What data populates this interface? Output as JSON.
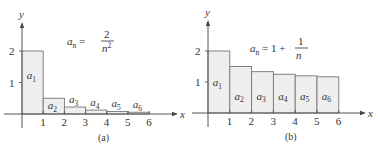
{
  "chart_data": [
    {
      "type": "bar",
      "panel": "a",
      "caption": "(a)",
      "formula": {
        "lhs": "a",
        "lhs_sub": "n",
        "eq": "=",
        "num": "2",
        "den": "n",
        "den_sup": "2"
      },
      "xlabel": "x",
      "ylabel": "y",
      "x_ticks": [
        "1",
        "2",
        "3",
        "4",
        "5",
        "6"
      ],
      "y_ticks": [
        "1",
        "2"
      ],
      "categories": [
        "a1",
        "a2",
        "a3",
        "a4",
        "a5",
        "a6"
      ],
      "bar_labels": [
        {
          "base": "a",
          "sub": "1"
        },
        {
          "base": "a",
          "sub": "2"
        },
        {
          "base": "a",
          "sub": "3"
        },
        {
          "base": "a",
          "sub": "4"
        },
        {
          "base": "a",
          "sub": "5"
        },
        {
          "base": "a",
          "sub": "6"
        }
      ],
      "values": [
        2.0,
        0.5,
        0.222,
        0.125,
        0.08,
        0.056
      ],
      "xlim": [
        0,
        6
      ],
      "ylim": [
        0,
        2.5
      ],
      "grid": false
    },
    {
      "type": "bar",
      "panel": "b",
      "caption": "(b)",
      "formula": {
        "lhs": "a",
        "lhs_sub": "n",
        "eq": "= 1 +",
        "num": "1",
        "den": "n"
      },
      "xlabel": "x",
      "ylabel": "y",
      "x_ticks": [
        "1",
        "2",
        "3",
        "4",
        "5",
        "6"
      ],
      "y_ticks": [
        "1",
        "2"
      ],
      "categories": [
        "a1",
        "a2",
        "a3",
        "a4",
        "a5",
        "a6"
      ],
      "bar_labels": [
        {
          "base": "a",
          "sub": "1"
        },
        {
          "base": "a",
          "sub": "2"
        },
        {
          "base": "a",
          "sub": "3"
        },
        {
          "base": "a",
          "sub": "4"
        },
        {
          "base": "a",
          "sub": "5"
        },
        {
          "base": "a",
          "sub": "6"
        }
      ],
      "values": [
        2.0,
        1.5,
        1.333,
        1.25,
        1.2,
        1.167
      ],
      "xlim": [
        0,
        6
      ],
      "ylim": [
        0,
        2.5
      ],
      "grid": false
    }
  ]
}
